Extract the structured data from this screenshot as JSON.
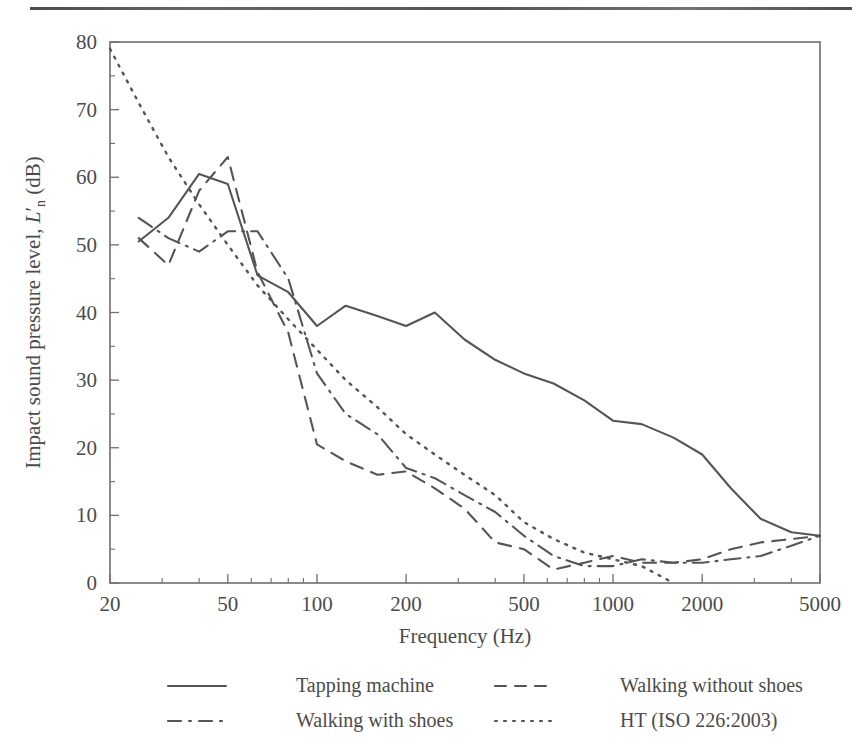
{
  "figure": {
    "has_top_rule": true
  },
  "chart_data": {
    "type": "line",
    "title": "",
    "xlabel": "Frequency (Hz)",
    "ylabel": "Impact sound pressure level, L'n (dB)",
    "ylabel_parts": {
      "before_italic": "Impact sound pressure level, ",
      "italic": "L",
      "prime": "′",
      "subscript": "n",
      "after": " (dB)"
    },
    "xscale": "log",
    "xlim": [
      20,
      5000
    ],
    "ylim": [
      0,
      80
    ],
    "grid": false,
    "legend_position": "below-axes",
    "xticks": [
      20,
      50,
      100,
      200,
      500,
      1000,
      2000,
      5000
    ],
    "xtick_labels": [
      "20",
      "50",
      "100",
      "200",
      "500",
      "1000",
      "2000",
      "5000"
    ],
    "yticks": [
      0,
      10,
      20,
      30,
      40,
      50,
      60,
      70,
      80
    ],
    "ytick_labels": [
      "0",
      "10",
      "20",
      "30",
      "40",
      "50",
      "60",
      "70",
      "80"
    ],
    "yminor_step": 5,
    "series": [
      {
        "name": "Tapping machine",
        "style": "solid",
        "x": [
          25,
          31.5,
          40,
          50,
          63,
          80,
          100,
          125,
          160,
          200,
          250,
          315,
          400,
          500,
          630,
          800,
          1000,
          1250,
          1600,
          2000,
          2500,
          3150,
          4000,
          5000
        ],
        "values": [
          50.5,
          54,
          60.5,
          59,
          45.5,
          43,
          38,
          41,
          39.5,
          38,
          40,
          36,
          33,
          31,
          29.5,
          27,
          24,
          23.5,
          21.5,
          19,
          14,
          9.5,
          7.5,
          7
        ]
      },
      {
        "name": "Walking without shoes",
        "style": "dashed",
        "x": [
          25,
          31.5,
          40,
          50,
          63,
          80,
          100,
          125,
          160,
          200,
          250,
          315,
          400,
          500,
          630,
          800,
          1000,
          1250,
          1600,
          2000,
          2500,
          3150,
          4000,
          5000
        ],
        "values": [
          51,
          47,
          58,
          63,
          46,
          37,
          20.5,
          18,
          16,
          16.5,
          14,
          11,
          6,
          5,
          2,
          3,
          4,
          3,
          3,
          3.5,
          5,
          6,
          6.5,
          7
        ]
      },
      {
        "name": "Walking with shoes",
        "style": "dashdot",
        "x": [
          25,
          31.5,
          40,
          50,
          63,
          80,
          100,
          125,
          160,
          200,
          250,
          315,
          400,
          500,
          630,
          800,
          1000,
          1250,
          1600,
          2000,
          2500,
          3150,
          4000,
          5000
        ],
        "values": [
          54,
          51,
          49,
          52,
          52,
          45,
          31,
          25,
          22,
          17,
          15.5,
          13,
          10.5,
          7,
          4,
          2.5,
          2.5,
          3.5,
          3,
          3,
          3.5,
          4,
          5.5,
          7
        ]
      },
      {
        "name": "HT (ISO 226:2003)",
        "style": "dotted",
        "x": [
          20,
          25,
          31.5,
          40,
          50,
          63,
          80,
          100,
          125,
          160,
          200,
          250,
          315,
          400,
          500,
          630,
          800,
          1000,
          1250,
          1600
        ],
        "values": [
          79,
          71,
          63,
          56,
          50,
          44,
          39,
          34.5,
          30,
          26,
          22,
          19,
          16,
          13,
          9,
          6.5,
          4.5,
          3.5,
          2.5,
          0
        ]
      }
    ]
  },
  "legend": {
    "entries": [
      {
        "label": "Tapping machine",
        "style": "solid"
      },
      {
        "label": "Walking without shoes",
        "style": "dashed"
      },
      {
        "label": "Walking with shoes",
        "style": "dashdot"
      },
      {
        "label": "HT (ISO 226:2003)",
        "style": "dotted"
      }
    ]
  }
}
